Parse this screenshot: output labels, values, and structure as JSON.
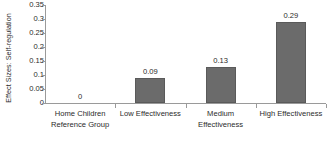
{
  "chart_data": {
    "type": "bar",
    "title": "",
    "xlabel": "",
    "ylabel": "Effect Sizes: Self-regulation",
    "categories": [
      "Home Children Reference Group",
      "Low Effectiveness",
      "Medium Effectiveness",
      "High Effectiveness"
    ],
    "category_lines": [
      [
        "Home Children",
        "Reference Group"
      ],
      [
        "Low Effectiveness"
      ],
      [
        "Medium",
        "Effectiveness"
      ],
      [
        "High Effectiveness"
      ]
    ],
    "values": [
      0,
      0.09,
      0.13,
      0.29
    ],
    "value_labels": [
      "0",
      "0.09",
      "0.13",
      "0.29"
    ],
    "ylim": [
      0,
      0.35
    ],
    "ytick_labels": [
      "0",
      "0.05",
      "0.1",
      "0.15",
      "0.2",
      "0.25",
      "0.3",
      "0.35"
    ],
    "ytick_values": [
      0,
      0.05,
      0.1,
      0.15,
      0.2,
      0.25,
      0.3,
      0.35
    ],
    "grid": false,
    "legend": false,
    "legend_position": "none",
    "bar_color": "#6b6b6b",
    "axis_color": "#9a9a9a",
    "background_color": "#ffffff",
    "text_color": "#2b2b2b"
  }
}
